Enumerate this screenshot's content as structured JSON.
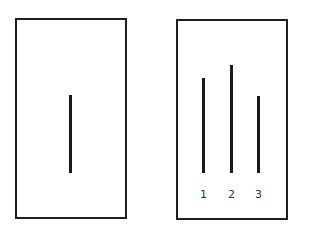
{
  "reference_card": {
    "box": {
      "x": 15,
      "y": 18,
      "w": 112,
      "h": 201
    },
    "line": {
      "x": 69,
      "y1": 95,
      "y2": 173
    }
  },
  "comparison_card": {
    "box": {
      "x": 176,
      "y": 19,
      "w": 112,
      "h": 201
    },
    "lines": [
      {
        "label": "1",
        "x": 202,
        "y1": 78,
        "y2": 173
      },
      {
        "label": "2",
        "x": 230,
        "y1": 65,
        "y2": 173
      },
      {
        "label": "3",
        "x": 257,
        "y1": 96,
        "y2": 173
      }
    ],
    "label_y": 189
  },
  "colors": {
    "stroke": "#1e1e1e",
    "text": "#333333",
    "background": "#ffffff"
  }
}
